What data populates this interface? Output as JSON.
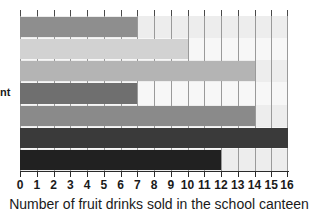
{
  "chart_data": {
    "type": "bar",
    "orientation": "horizontal",
    "title": "",
    "xlabel": "Number of fruit drinks sold in the school canteen",
    "ylabel": "nt",
    "ylabel_note": "cut off at left edge of image",
    "xlim": [
      0,
      16
    ],
    "xtick_step": 1,
    "grid": true,
    "legend": "none",
    "categories": [
      "bar-1",
      "bar-2",
      "bar-3",
      "bar-4",
      "bar-5",
      "bar-6",
      "bar-7"
    ],
    "values": [
      7,
      10,
      14,
      7,
      14,
      16,
      12
    ],
    "bar_colors": [
      "#8e8e8e",
      "#d2d2d2",
      "#b4b4b4",
      "#6f6f6f",
      "#8a8a8a",
      "#3a3a3a",
      "#212121"
    ],
    "band_colors": [
      "#ededed",
      "#f7f7f7",
      "#ededed",
      "#f7f7f7",
      "#ededed",
      "#f7f7f7",
      "#ededed"
    ],
    "tick_labels": [
      "0",
      "1",
      "2",
      "3",
      "4",
      "5",
      "6",
      "7",
      "8",
      "9",
      "10",
      "11",
      "12",
      "13",
      "14",
      "15",
      "16"
    ]
  },
  "axis": {
    "caption": "Number of fruit drinks sold in the school canteen",
    "y_label_clipped": "nt"
  }
}
